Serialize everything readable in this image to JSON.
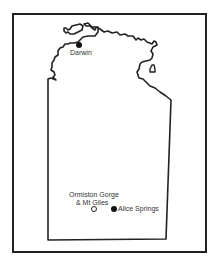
{
  "map": {
    "region": "Northern Territory",
    "colors": {
      "outline": "#222222",
      "background": "#ffffff",
      "text": "#333333"
    },
    "places": [
      {
        "name": "Darwin",
        "marker": "filled-circle"
      },
      {
        "name": "Ormiston Gorge",
        "name_line2": "& Mt Giles",
        "marker": "open-circle"
      },
      {
        "name": "Alice Springs",
        "marker": "filled-circle"
      }
    ]
  }
}
